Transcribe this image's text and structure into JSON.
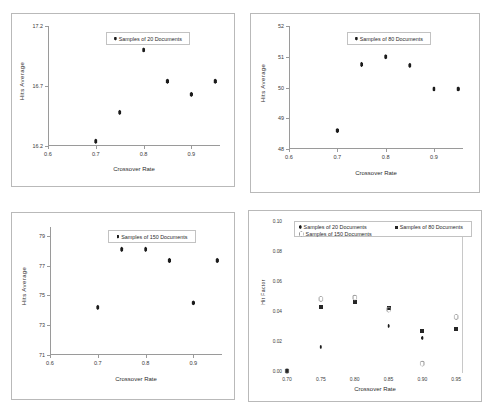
{
  "figure": {
    "panels": 4,
    "shared_xlabel": "Crossover Rate",
    "shared_ylabel": "Hits Average"
  },
  "chart_data": [
    {
      "type": "scatter",
      "title": "",
      "xlabel": "Crossover Rate",
      "ylabel": "Hits Average",
      "xlim": [
        0.6,
        0.96
      ],
      "ylim": [
        16.2,
        17.2
      ],
      "xticks": [
        "0.6",
        "0.7",
        "0.8",
        "0.9"
      ],
      "xtick_values": [
        0.6,
        0.7,
        0.8,
        0.9
      ],
      "yticks": [
        "17.2",
        "16.7",
        "16.2"
      ],
      "ytick_values": [
        17.2,
        16.7,
        16.2
      ],
      "grid": false,
      "legend_position": "top-center",
      "series": [
        {
          "name": "Samples of 20 Documents",
          "marker": "diamond",
          "color": "#1b1b1b",
          "x": [
            0.7,
            0.75,
            0.8,
            0.85,
            0.9,
            0.95
          ],
          "values": [
            16.24,
            16.48,
            17.0,
            16.74,
            16.63,
            16.74
          ]
        }
      ]
    },
    {
      "type": "scatter",
      "title": "",
      "xlabel": "Crossover Rate",
      "ylabel": "Hits Average",
      "xlim": [
        0.6,
        0.96
      ],
      "ylim": [
        48,
        52
      ],
      "xticks": [
        "0.6",
        "0.7",
        "0.8",
        "0.9"
      ],
      "xtick_values": [
        0.6,
        0.7,
        0.8,
        0.9
      ],
      "yticks": [
        "52",
        "51",
        "50",
        "49",
        "48"
      ],
      "ytick_values": [
        52,
        51,
        50,
        49,
        48
      ],
      "grid": false,
      "legend_position": "top-center",
      "series": [
        {
          "name": "Samples of 80 Documents",
          "marker": "diamond",
          "color": "#1b1b1b",
          "x": [
            0.7,
            0.75,
            0.8,
            0.85,
            0.9,
            0.95
          ],
          "values": [
            48.6,
            50.75,
            51.0,
            50.72,
            49.95,
            49.95
          ]
        }
      ]
    },
    {
      "type": "scatter",
      "title": "",
      "xlabel": "Crossover Rate",
      "ylabel": "Hits Average",
      "xlim": [
        0.6,
        0.96
      ],
      "ylim": [
        71,
        79.6
      ],
      "xticks": [
        "0.6",
        "0.7",
        "0.8",
        "0.9"
      ],
      "xtick_values": [
        0.6,
        0.7,
        0.8,
        0.9
      ],
      "yticks": [
        "79",
        "77",
        "75",
        "73",
        "71"
      ],
      "ytick_values": [
        79,
        77,
        75,
        73,
        71
      ],
      "grid": false,
      "legend_position": "top-center",
      "series": [
        {
          "name": "Samples of 150 Documents",
          "marker": "diamond",
          "color": "#1b1b1b",
          "x": [
            0.7,
            0.75,
            0.8,
            0.85,
            0.9,
            0.95
          ],
          "values": [
            74.2,
            78.1,
            78.1,
            77.35,
            74.5,
            77.35
          ]
        }
      ]
    },
    {
      "type": "scatter",
      "title": "",
      "xlabel": "Crossover Rate",
      "ylabel": "Hit Factor",
      "xlim": [
        0.7,
        0.96
      ],
      "ylim": [
        0.0,
        0.1
      ],
      "xticks": [
        "0.70",
        "0.75",
        "0.80",
        "0.85",
        "0.90",
        "0.95"
      ],
      "xtick_values": [
        0.7,
        0.75,
        0.8,
        0.85,
        0.9,
        0.95
      ],
      "yticks": [
        "0.10",
        "0.08",
        "0.06",
        "0.04",
        "0.02",
        "0.00"
      ],
      "ytick_values": [
        0.1,
        0.08,
        0.06,
        0.04,
        0.02,
        0.0
      ],
      "grid": false,
      "legend_position": "top-center",
      "series": [
        {
          "name": "Samples of  20 Documents",
          "marker": "diamond",
          "color": "#1b1b1b",
          "x": [
            0.7,
            0.75,
            0.8,
            0.85,
            0.9,
            0.95
          ],
          "values": [
            0.0,
            0.016,
            0.046,
            0.03,
            0.022,
            0.028
          ]
        },
        {
          "name": "Samples of  80 Documents",
          "marker": "square",
          "color": "#262626",
          "x": [
            0.7,
            0.75,
            0.8,
            0.85,
            0.9,
            0.95
          ],
          "values": [
            0.0,
            0.043,
            0.046,
            0.042,
            0.027,
            0.028
          ]
        },
        {
          "name": "Samples of  150 Documents",
          "marker": "open-diamond",
          "color": "#8d8d8d",
          "x": [
            0.7,
            0.75,
            0.8,
            0.85,
            0.9,
            0.95
          ],
          "values": [
            0.0,
            0.048,
            0.049,
            0.041,
            0.005,
            0.036
          ]
        }
      ]
    }
  ]
}
